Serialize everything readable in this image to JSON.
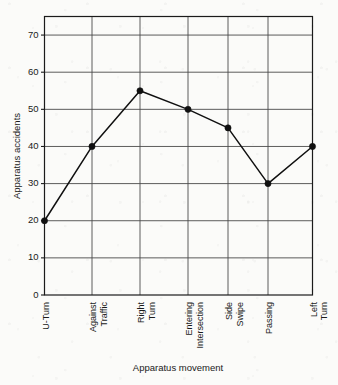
{
  "chart_data": {
    "type": "line",
    "title": "",
    "xlabel": "Apparatus movement",
    "ylabel": "Apparatus accidents",
    "categories": [
      "U-Turn",
      "Against Traffic",
      "Right Turn",
      "Entering Intersection",
      "Side Swipe",
      "Passing",
      "Left Turn"
    ],
    "category_lines": [
      [
        "U-Turn"
      ],
      [
        "Against",
        "Traffic"
      ],
      [
        "Right",
        "Turn"
      ],
      [
        "Entering",
        "Intersection"
      ],
      [
        "Side",
        "Swipe"
      ],
      [
        "Passing"
      ],
      [
        "Left",
        "Turn"
      ]
    ],
    "values": [
      20,
      40,
      55,
      50,
      45,
      30,
      40
    ],
    "ylim": [
      0,
      75
    ],
    "yticks": [
      0,
      10,
      20,
      30,
      40,
      50,
      60,
      70
    ],
    "ytick_labels": [
      "0",
      "10",
      "20",
      "30",
      "40",
      "50",
      "60",
      "70"
    ],
    "grid": "both",
    "legend": "none",
    "marker": "filled-circle",
    "line_color": "#101010",
    "grid_color": "#4a4a4a",
    "axis_color": "#1b1b1b",
    "background_color": "#fbfbf9"
  }
}
